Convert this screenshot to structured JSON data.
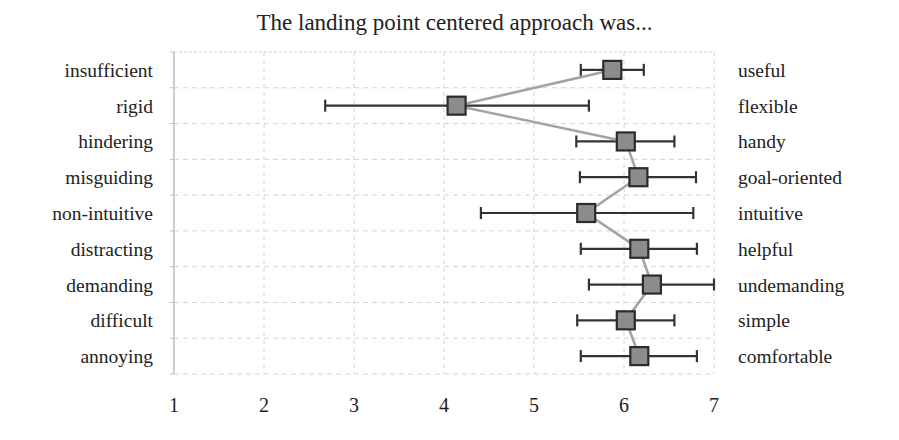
{
  "chart_data": {
    "type": "scatter",
    "subtype": "semantic-differential-with-error-bars",
    "title": "The landing point centered approach was...",
    "xlabel": "",
    "ylabel": "",
    "xlim": [
      1,
      7
    ],
    "x_ticks": [
      "1",
      "2",
      "3",
      "4",
      "5",
      "6",
      "7"
    ],
    "grid": true,
    "legend": null,
    "categories_left": [
      "insufficient",
      "rigid",
      "hindering",
      "misguiding",
      "non-intuitive",
      "distracting",
      "demanding",
      "difficult",
      "annoying"
    ],
    "categories_right": [
      "useful",
      "flexible",
      "handy",
      "goal-oriented",
      "intuitive",
      "helpful",
      "undemanding",
      "simple",
      "comfortable"
    ],
    "series": [
      {
        "name": "mean",
        "values": [
          5.87,
          4.14,
          6.02,
          6.16,
          5.58,
          6.17,
          6.31,
          6.02,
          6.17
        ],
        "error_low": [
          5.52,
          2.68,
          5.47,
          5.51,
          4.41,
          5.52,
          5.61,
          5.48,
          5.52
        ],
        "error_high": [
          6.22,
          5.61,
          6.56,
          6.8,
          6.77,
          6.81,
          7.0,
          6.56,
          6.81
        ]
      }
    ]
  },
  "style": {
    "marker_fill": "#8c8c8c",
    "marker_stroke": "#2b2b2b",
    "line_color": "#a3a3a3",
    "errorbar_color": "#333333",
    "grid_color": "#d4d4d4",
    "axis_color": "#bdbdbd"
  }
}
